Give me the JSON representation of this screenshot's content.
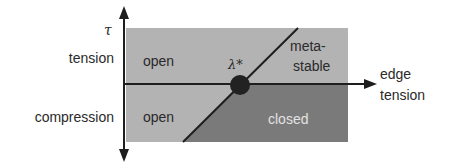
{
  "diagram": {
    "type": "phase-diagram",
    "y_axis": {
      "symbol": "τ",
      "positive_label": "tension",
      "negative_label": "compression"
    },
    "x_axis": {
      "label_line1": "edge",
      "label_line2": "tension"
    },
    "critical_point": {
      "label": "λ*"
    },
    "regions": {
      "top_left": "open",
      "bottom_left": "open",
      "top_right_line1": "meta-",
      "top_right_line2": "stable",
      "bottom_right": "closed"
    },
    "colors": {
      "open_region": "#b3b3b3",
      "closed_region": "#7a7a7a",
      "axis": "#1e1e1e",
      "point": "#222222"
    }
  }
}
